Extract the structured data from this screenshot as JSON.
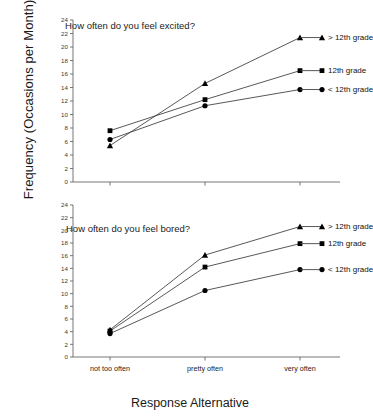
{
  "axes": {
    "ylabel": "Frequency (Occasions per Month)",
    "xlabel": "Response Alternative"
  },
  "panels": [
    {
      "id": "excited",
      "title": "How often do you feel excited?",
      "legend": [
        {
          "label": "> 12th grade",
          "marker": "triangle"
        },
        {
          "label": "12th grade",
          "marker": "square"
        },
        {
          "label": "< 12th grade",
          "marker": "circle"
        }
      ]
    },
    {
      "id": "bored",
      "title": "How often do you feel bored?",
      "legend": [
        {
          "label": "> 12th grade",
          "marker": "triangle"
        },
        {
          "label": "12th grade",
          "marker": "square"
        },
        {
          "label": "< 12th grade",
          "marker": "circle"
        }
      ]
    }
  ],
  "chart_data": [
    {
      "type": "line",
      "id": "excited",
      "title": "How often do you feel excited?",
      "xlabel": "Response Alternative",
      "ylabel": "Frequency (Occasions per Month)",
      "categories": [
        "not too often",
        "pretty often",
        "very often"
      ],
      "ylim": [
        0,
        24
      ],
      "yticks": [
        0,
        2,
        4,
        6,
        8,
        10,
        12,
        14,
        16,
        18,
        20,
        22,
        24
      ],
      "grid": false,
      "legend_position": "right-inline",
      "series": [
        {
          "name": "> 12th grade",
          "marker": "triangle",
          "values": [
            5.4,
            14.6,
            21.4
          ]
        },
        {
          "name": "12th grade",
          "marker": "square",
          "values": [
            7.6,
            12.2,
            16.5
          ]
        },
        {
          "name": "< 12th grade",
          "marker": "circle",
          "values": [
            6.3,
            11.3,
            13.7
          ]
        }
      ]
    },
    {
      "type": "line",
      "id": "bored",
      "title": "How often do you feel bored?",
      "xlabel": "Response Alternative",
      "ylabel": "Frequency (Occasions per Month)",
      "categories": [
        "not too often",
        "pretty often",
        "very often"
      ],
      "ylim": [
        0,
        24
      ],
      "yticks": [
        0,
        2,
        4,
        6,
        8,
        10,
        12,
        14,
        16,
        18,
        20,
        22,
        24
      ],
      "grid": false,
      "legend_position": "right-inline",
      "series": [
        {
          "name": "> 12th grade",
          "marker": "triangle",
          "values": [
            4.3,
            16.1,
            20.6
          ]
        },
        {
          "name": "12th grade",
          "marker": "square",
          "values": [
            4.1,
            14.2,
            17.9
          ]
        },
        {
          "name": "< 12th grade",
          "marker": "circle",
          "values": [
            3.7,
            10.5,
            13.8
          ]
        }
      ]
    }
  ]
}
